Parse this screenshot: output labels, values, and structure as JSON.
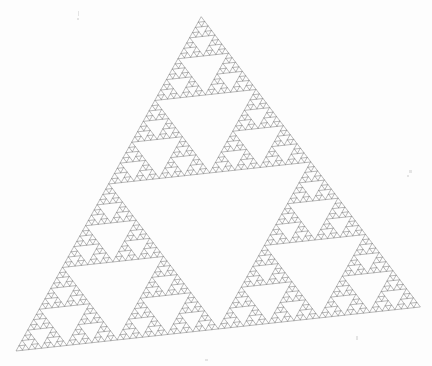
{
  "figure": {
    "name": "Sierpinski Triangle",
    "width": 432,
    "height": 366,
    "background_color": "#fdfdfd",
    "stroke_color": "#808080",
    "fill_color": "none",
    "stroke_width": 0.55,
    "rendering": "line-drawing"
  },
  "chart_data": {
    "type": "line",
    "title": "",
    "subtitle": "",
    "xlabel": "",
    "ylabel": "",
    "grid": false,
    "legend": false,
    "fractal": {
      "name": "Sierpinski triangle",
      "construction": "recursive-subdivision",
      "depth": 6,
      "subtriangles_per_level": 3,
      "total_filled_triangles": 729,
      "hausdorff_dimension": 1.585,
      "outline_only": true
    },
    "vertices": {
      "apex": [
        201,
        17
      ],
      "bottom_left": [
        16,
        351
      ],
      "bottom_right": [
        420,
        307
      ]
    },
    "axis_ranges": {
      "xlim": [
        0,
        432
      ],
      "ylim": [
        0,
        366
      ]
    },
    "annotations": []
  },
  "artifacts": {
    "specks": [
      {
        "x": 78,
        "y": 11,
        "w": 1,
        "h": 5
      },
      {
        "x": 77,
        "y": 18,
        "w": 2,
        "h": 2
      },
      {
        "x": 409,
        "y": 170,
        "w": 3,
        "h": 3
      },
      {
        "x": 407,
        "y": 175,
        "w": 2,
        "h": 2
      },
      {
        "x": 205,
        "y": 359,
        "w": 3,
        "h": 2
      },
      {
        "x": 356,
        "y": 336,
        "w": 2,
        "h": 4
      }
    ]
  }
}
